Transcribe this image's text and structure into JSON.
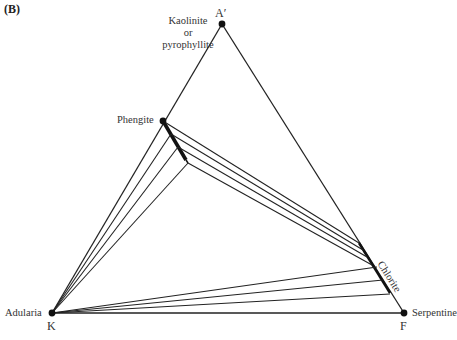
{
  "figure": {
    "panel_label": "(B)",
    "vertices": {
      "apex": {
        "label": "A′",
        "x": 222,
        "y": 24
      },
      "left": {
        "label": "K",
        "x": 52,
        "y": 313
      },
      "right": {
        "label": "F",
        "x": 404,
        "y": 313
      }
    },
    "phases": {
      "kaolinite": {
        "line1": "Kaolinite",
        "line2": "or",
        "line3": "pyrophyllite"
      },
      "phengite": "Phengite",
      "chlorite": "Chlorite",
      "adularia": "Adularia",
      "serpentine": "Serpentine"
    },
    "colors": {
      "line": "#222222",
      "text": "#333333",
      "background": "#ffffff"
    }
  }
}
